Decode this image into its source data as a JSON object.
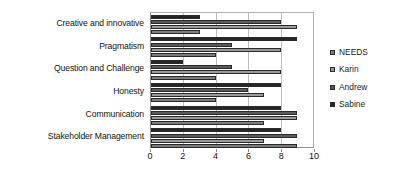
{
  "chart_data": {
    "type": "bar",
    "orientation": "horizontal",
    "title": "",
    "xlabel": "",
    "ylabel": "",
    "xlim": [
      0,
      10
    ],
    "xticks": [
      0,
      2,
      4,
      6,
      8,
      10
    ],
    "xtick_labels": [
      "0",
      "2",
      "4",
      "6",
      "8",
      "10"
    ],
    "grid": true,
    "legend_position": "right",
    "categories": [
      "Creative and innovative",
      "Pragmatism",
      "Question and Challenge",
      "Honesty",
      "Communication",
      "Stakeholder Management"
    ],
    "series": [
      {
        "name": "NEEDS",
        "color": "#7d7d7d",
        "values": [
          3,
          4,
          4,
          4,
          7,
          9
        ]
      },
      {
        "name": "Karin",
        "color": "#9a9a9a",
        "values": [
          9,
          8,
          8,
          7,
          9,
          7
        ]
      },
      {
        "name": "Andrew",
        "color": "#5a5a5a",
        "values": [
          8,
          5,
          5,
          6,
          9,
          9
        ]
      },
      {
        "name": "Sabine",
        "color": "#252525",
        "values": [
          3,
          9,
          2,
          8,
          8,
          8
        ]
      }
    ]
  },
  "legend": {
    "items": [
      {
        "label": "NEEDS"
      },
      {
        "label": "Karin"
      },
      {
        "label": "Andrew"
      },
      {
        "label": "Sabine"
      }
    ]
  }
}
